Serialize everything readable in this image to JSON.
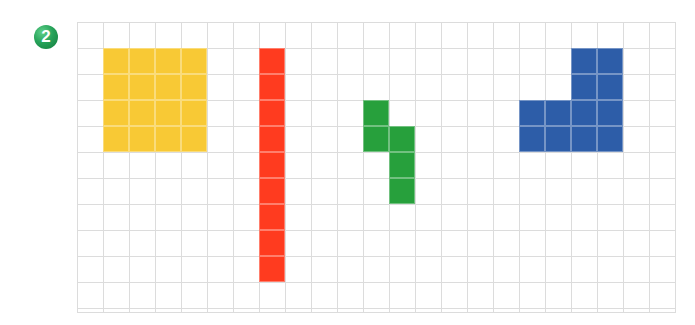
{
  "badge": {
    "label": "2",
    "color": "#27a35a"
  },
  "grid": {
    "cols": 23,
    "rows": 11,
    "cell_size": 26,
    "line_color": "#dcdcdc"
  },
  "shapes": [
    {
      "name": "yellow-square",
      "color": "#f8c935",
      "cells": [
        [
          1,
          1
        ],
        [
          2,
          1
        ],
        [
          3,
          1
        ],
        [
          4,
          1
        ],
        [
          1,
          2
        ],
        [
          2,
          2
        ],
        [
          3,
          2
        ],
        [
          4,
          2
        ],
        [
          1,
          3
        ],
        [
          2,
          3
        ],
        [
          3,
          3
        ],
        [
          4,
          3
        ],
        [
          1,
          4
        ],
        [
          2,
          4
        ],
        [
          3,
          4
        ],
        [
          4,
          4
        ]
      ]
    },
    {
      "name": "red-bar",
      "color": "#ff3b1f",
      "cells": [
        [
          7,
          1
        ],
        [
          7,
          2
        ],
        [
          7,
          3
        ],
        [
          7,
          4
        ],
        [
          7,
          5
        ],
        [
          7,
          6
        ],
        [
          7,
          7
        ],
        [
          7,
          8
        ],
        [
          7,
          9
        ]
      ]
    },
    {
      "name": "green-shape",
      "color": "#27a03c",
      "cells": [
        [
          11,
          3
        ],
        [
          11,
          4
        ],
        [
          12,
          4
        ],
        [
          12,
          5
        ],
        [
          12,
          6
        ]
      ]
    },
    {
      "name": "blue-shape",
      "color": "#2d5da8",
      "cells": [
        [
          19,
          1
        ],
        [
          20,
          1
        ],
        [
          19,
          2
        ],
        [
          20,
          2
        ],
        [
          17,
          3
        ],
        [
          18,
          3
        ],
        [
          19,
          3
        ],
        [
          20,
          3
        ],
        [
          17,
          4
        ],
        [
          18,
          4
        ],
        [
          19,
          4
        ],
        [
          20,
          4
        ]
      ]
    }
  ]
}
